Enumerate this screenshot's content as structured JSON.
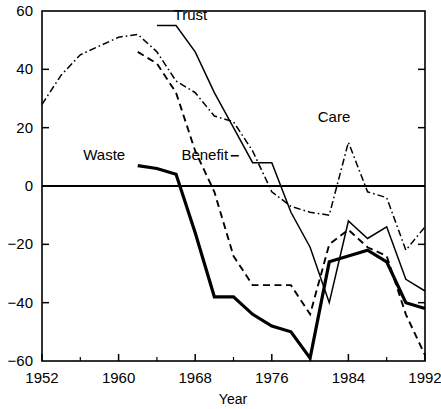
{
  "chart_data": {
    "type": "line",
    "title": "",
    "xlabel": "Year",
    "ylabel": "",
    "xlim": [
      1952,
      1992
    ],
    "ylim": [
      -60,
      60
    ],
    "grid": false,
    "legend_position": "inline-annotations",
    "x_ticks": [
      1952,
      1960,
      1968,
      1976,
      1984,
      1992
    ],
    "x_minor_ticks": [
      1956,
      1964,
      1972,
      1980,
      1988
    ],
    "y_ticks": [
      -60,
      -40,
      -20,
      0,
      20,
      40,
      60
    ],
    "zero_line": 0,
    "series": [
      {
        "name": "Trust",
        "style": "solid-thin",
        "label_x": 1967.5,
        "label_y": 57,
        "x": [
          1964,
          1966,
          1968,
          1970,
          1972,
          1974,
          1976,
          1978,
          1980,
          1982,
          1984,
          1986,
          1988,
          1990,
          1992
        ],
        "values": [
          55,
          55,
          46,
          32,
          20,
          8,
          8,
          -9,
          -21,
          -40,
          -12,
          -18,
          -14,
          -32,
          -36
        ]
      },
      {
        "name": "Care",
        "style": "dash-dot",
        "label_x": 1982.5,
        "label_y": 22,
        "x": [
          1952,
          1954,
          1956,
          1958,
          1960,
          1962,
          1964,
          1966,
          1968,
          1970,
          1972,
          1974,
          1976,
          1978,
          1980,
          1982,
          1984,
          1986,
          1988,
          1990,
          1992
        ],
        "values": [
          28,
          38,
          45,
          48,
          51,
          52,
          46,
          36,
          32,
          24,
          22,
          12,
          -2,
          -7,
          -9,
          -10,
          15,
          -2,
          -4,
          -22,
          -14
        ]
      },
      {
        "name": "Waste",
        "style": "solid-thick",
        "label_x": 1958.5,
        "label_y": 9,
        "x": [
          1962,
          1964,
          1966,
          1968,
          1970,
          1972,
          1974,
          1976,
          1978,
          1980,
          1982,
          1984,
          1986,
          1988,
          1990,
          1992
        ],
        "values": [
          7,
          6,
          4,
          -16,
          -38,
          -38,
          -44,
          -48,
          -50,
          -59,
          -26,
          -24,
          -22,
          -26,
          -40,
          -42
        ]
      },
      {
        "name": "Benefit",
        "style": "dashed",
        "label_x": 1969,
        "label_y": 9,
        "x": [
          1962,
          1964,
          1966,
          1968,
          1970,
          1972,
          1974,
          1976,
          1978,
          1980,
          1982,
          1984,
          1986,
          1988,
          1990,
          1992
        ],
        "values": [
          46,
          42,
          32,
          12,
          -2,
          -24,
          -34,
          -34,
          -34,
          -44,
          -20,
          -15,
          -21,
          -24,
          -44,
          -58
        ]
      }
    ]
  },
  "axes": {
    "x_tick_labels": [
      "1952",
      "1960",
      "1968",
      "1976",
      "1984",
      "1992"
    ],
    "y_tick_labels": [
      "60",
      "40",
      "20",
      "0",
      "−20",
      "−40",
      "−60"
    ],
    "x_axis_title": "Year"
  },
  "annotations": {
    "trust": "Trust",
    "care": "Care",
    "waste": "Waste",
    "benefit": "Benefit"
  }
}
